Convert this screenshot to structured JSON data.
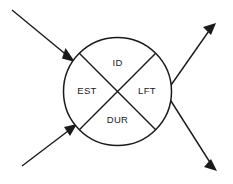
{
  "diagram": {
    "canvas": {
      "width": 233,
      "height": 184,
      "background": "#ffffff"
    },
    "stroke_color": "#1a1a1a",
    "text_color": "#1a1a1a",
    "node": {
      "shape": "circle",
      "center_x": 117.5,
      "center_y": 91.5,
      "radius": 54,
      "divided_by": "diagonal-cross",
      "quadrants": [
        {
          "position": "top",
          "label": "ID",
          "x": 117.5,
          "y": 63
        },
        {
          "position": "left",
          "label": "EST",
          "x": 87,
          "y": 91.5
        },
        {
          "position": "right",
          "label": "LFT",
          "x": 147,
          "y": 91.5
        },
        {
          "position": "bottom",
          "label": "DUR",
          "x": 117.5,
          "y": 120
        }
      ]
    },
    "connectors": [
      {
        "name": "incoming-arrow-top-left",
        "direction": "incoming",
        "from_x": 12,
        "from_y": 10,
        "to_x": 75,
        "to_y": 62
      },
      {
        "name": "incoming-arrow-bottom-left",
        "direction": "incoming",
        "from_x": 22,
        "from_y": 166,
        "to_x": 68,
        "to_y": 124
      },
      {
        "name": "outgoing-arrow-top-right",
        "direction": "outgoing",
        "from_x": 148,
        "from_y": 118,
        "to_x": 216,
        "to_y": 23
      },
      {
        "name": "outgoing-arrow-bottom-right",
        "direction": "outgoing",
        "from_x": 150,
        "from_y": 68,
        "to_x": 217,
        "to_y": 171
      }
    ]
  }
}
